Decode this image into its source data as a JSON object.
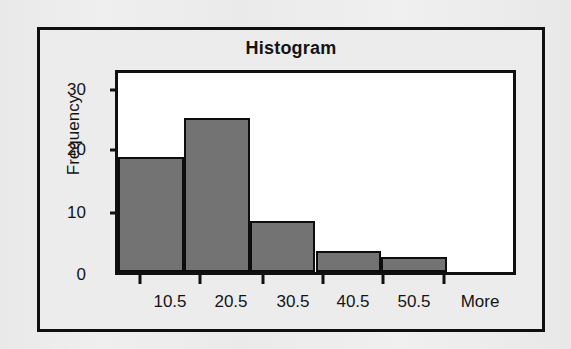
{
  "chart_data": {
    "type": "bar",
    "title": "Histogram",
    "xlabel": "",
    "ylabel": "Frequency",
    "categories": [
      "10.5",
      "20.5",
      "30.5",
      "40.5",
      "50.5",
      "More"
    ],
    "values": [
      19,
      25.5,
      8.5,
      3.5,
      2.5,
      0
    ],
    "ylim": [
      0,
      33
    ],
    "y_ticks": [
      0,
      10,
      20,
      30
    ],
    "y_tick_labels": [
      "0",
      "10",
      "20",
      "30"
    ],
    "grid": false,
    "legend": "none",
    "series": [
      {
        "name": "Frequency",
        "values": [
          19,
          25.5,
          8.5,
          3.5,
          2.5,
          0
        ]
      }
    ],
    "bar_color": "#737373",
    "bar_border_color": "#0d0d0d",
    "plot_background": "#ffffff",
    "frame_color": "#0f0f0f",
    "page_background": "#eeeeee"
  }
}
